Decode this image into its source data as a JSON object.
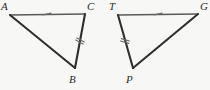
{
  "figure": {
    "kind": "geometry-diagram",
    "background_color": "#f7f7f5",
    "width": 210,
    "height": 90,
    "stroke_light": "#5a5a5a",
    "stroke_dark": "#2f2f2f",
    "tick_color": "#6b6b6b"
  },
  "triangles": [
    {
      "id": "triangle-acb",
      "name": "triangle-ACB",
      "vertices": [
        {
          "label": "A",
          "x": 10,
          "y": 15,
          "label_x": 1,
          "label_y": 1
        },
        {
          "label": "C",
          "x": 85,
          "y": 14,
          "label_x": 87,
          "label_y": 1
        },
        {
          "label": "B",
          "x": 75,
          "y": 68,
          "label_x": 69,
          "label_y": 74
        }
      ],
      "sides": [
        {
          "name": "side-AC",
          "from": "A",
          "to": "C",
          "weight": "light",
          "ticks": 1
        },
        {
          "name": "side-CB",
          "from": "C",
          "to": "B",
          "weight": "dark",
          "ticks": 2
        },
        {
          "name": "side-AB",
          "from": "A",
          "to": "B",
          "weight": "dark",
          "ticks": 0
        }
      ]
    },
    {
      "id": "triangle-tpg",
      "name": "triangle-TPG",
      "vertices": [
        {
          "label": "T",
          "x": 118,
          "y": 15,
          "label_x": 109,
          "label_y": 1
        },
        {
          "label": "G",
          "x": 198,
          "y": 14,
          "label_x": 200,
          "label_y": 1
        },
        {
          "label": "P",
          "x": 133,
          "y": 68,
          "label_x": 126,
          "label_y": 74
        }
      ],
      "sides": [
        {
          "name": "side-TG",
          "from": "T",
          "to": "G",
          "weight": "light",
          "ticks": 1
        },
        {
          "name": "side-TP",
          "from": "T",
          "to": "P",
          "weight": "dark",
          "ticks": 2
        },
        {
          "name": "side-PG",
          "from": "P",
          "to": "G",
          "weight": "dark",
          "ticks": 0
        }
      ]
    }
  ],
  "tick_marks": [
    {
      "name": "tick-side-AC",
      "x": 47,
      "y": 14,
      "count": 1,
      "angle": 78
    },
    {
      "name": "tick-side-CB",
      "x": 80,
      "y": 41,
      "count": 2,
      "angle": -62
    },
    {
      "name": "tick-side-TG",
      "x": 158,
      "y": 14,
      "count": 1,
      "angle": 78
    },
    {
      "name": "tick-side-TP",
      "x": 125,
      "y": 41,
      "count": 2,
      "angle": -74
    }
  ]
}
